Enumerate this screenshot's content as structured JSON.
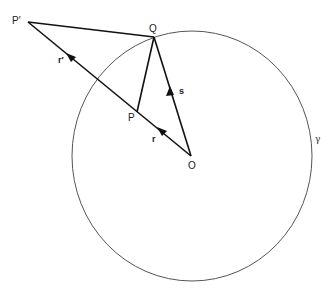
{
  "diagram": {
    "type": "geometry",
    "colors": {
      "stroke": "#111111",
      "circle": "#555555",
      "background": "#ffffff"
    },
    "circle": {
      "label": "γ",
      "center_point": "O"
    },
    "points": {
      "P_prime": "P′",
      "Q": "Q",
      "P": "P",
      "O": "O"
    },
    "vectors": {
      "r": "r",
      "r_prime": "r′",
      "s": "s"
    },
    "segments": [
      "P′Q",
      "QP",
      "OP′",
      "OQ"
    ]
  }
}
